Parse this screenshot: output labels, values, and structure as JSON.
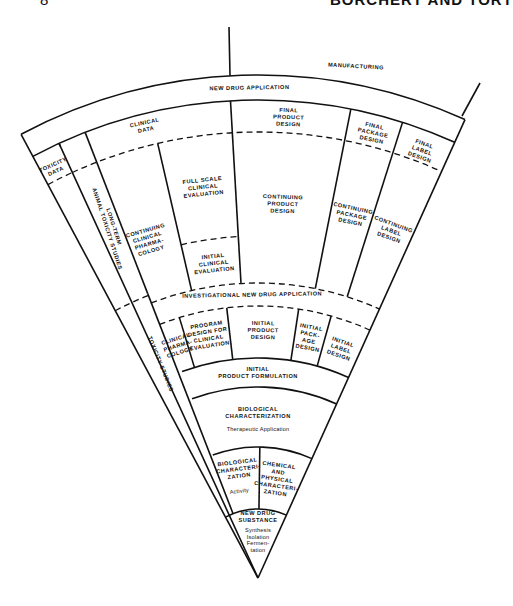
{
  "header": {
    "left_fragment": "8",
    "right_running_head": "BORCHERT AND TORT"
  },
  "figure": {
    "apex": [
      258,
      578
    ],
    "left_angle_deg": -28.1,
    "right_angle_deg": 24.3,
    "radii": {
      "outer": 503,
      "nda_inner": 478,
      "final_dashed": 446,
      "clinical_sub_dashed": 342,
      "ind_outer_dashed": 295,
      "ind_inner_dashed": 272,
      "initial_row_inner": 220,
      "formulation_inner": 191,
      "bio_char_inner": 131,
      "lower_inner": 69
    },
    "manufacturing_divider": {
      "x1": 229,
      "y1": 27,
      "x2": 230,
      "y2": 76
    },
    "manufacturing_right_line": {
      "x1": 480,
      "y1": 83,
      "x2": 462,
      "y2": 116
    },
    "labels": {
      "manufacturing": "MANUFACTURING",
      "new_drug_application": "NEW DRUG APPLICATION",
      "clinical_data": [
        "CLINICAL",
        "DATA"
      ],
      "toxicity_data": [
        "TOXICITY",
        "DATA"
      ],
      "long_term_studies": [
        "LONG-TERM",
        "ANIMAL TOXICITY STUDIES"
      ],
      "continuing_clinical_pharmacology": [
        "CONTINUING",
        "CLINICAL",
        "PHARMA-",
        "COLOGY"
      ],
      "full_scale_clinical_evaluation": [
        "FULL SCALE",
        "CLINICAL",
        "EVALUATION"
      ],
      "initial_clinical_evaluation": [
        "INITIAL",
        "CLINICAL",
        "EVALUATION"
      ],
      "final_product_design": [
        "FINAL",
        "PRODUCT",
        "DESIGN"
      ],
      "continuing_product_design": [
        "CONTINUING",
        "PRODUCT",
        "DESIGN"
      ],
      "final_package_design": [
        "FINAL",
        "PACKAGE",
        "DESIGN"
      ],
      "continuing_package_design": [
        "CONTINUING",
        "PACKAGE",
        "DESIGN"
      ],
      "final_label_design": [
        "FINAL",
        "LABEL",
        "DESIGN"
      ],
      "continuing_label_design": [
        "CONTINUING",
        "LABEL",
        "DESIGN"
      ],
      "investigational_new_drug_application": "INVESTIGATIONAL NEW DRUG APPLICATION",
      "toxicity_studies": "TOXICITY STUDIES",
      "clinical_pharmacology": [
        "CLINICAL",
        "PHARMA-",
        "COLOGY"
      ],
      "program_design": [
        "PROGRAM",
        "DESIGN FOR",
        "CLINICAL",
        "EVALUATION"
      ],
      "initial_product_design": [
        "INITIAL",
        "PRODUCT",
        "DESIGN"
      ],
      "initial_package_design": [
        "INITIAL",
        "PACK-",
        "AGE",
        "DESIGN"
      ],
      "initial_label_design": [
        "INITIAL",
        "LABEL",
        "DESIGN"
      ],
      "initial_product_formulation": [
        "INITIAL",
        "PRODUCT FORMULATION"
      ],
      "biological_characterization_therapeutic": [
        "BIOLOGICAL",
        "CHARACTERIZATION"
      ],
      "therapeutic_application": "Therapeutic Application",
      "biological_characterization_activity": [
        "BIOLOGICAL",
        "CHARACTERI-",
        "ZATION"
      ],
      "activity": "Activity",
      "chemical_physical_characterization": [
        "CHEMICAL",
        "AND",
        "PHYSICAL",
        "CHARACTERI-",
        "ZATION"
      ],
      "new_drug_substance": [
        "NEW DRUG",
        "SUBSTANCE"
      ],
      "synthesis_steps": [
        "Synthesis",
        "Isolation",
        "Fermen-",
        "tation"
      ]
    }
  }
}
